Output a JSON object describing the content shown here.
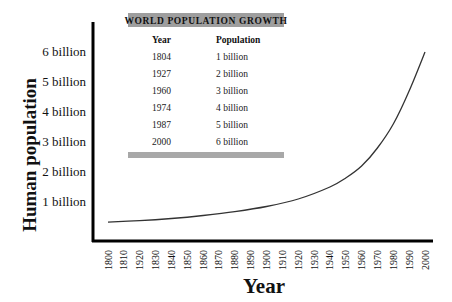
{
  "chart_data": {
    "type": "line",
    "title": "",
    "xlabel": "Year",
    "ylabel": "Human population",
    "x_ticks": [
      "1800",
      "1810",
      "1920",
      "1830",
      "1840",
      "1850",
      "1860",
      "1870",
      "1880",
      "1890",
      "1900",
      "1910",
      "1920",
      "1930",
      "1940",
      "1950",
      "1960",
      "1970",
      "1980",
      "1990",
      "2000"
    ],
    "y_ticks": [
      "1 billion",
      "2 billion",
      "3 billion",
      "4 billion",
      "5 billion",
      "6 billion"
    ],
    "xlim": [
      1800,
      2000
    ],
    "ylim": [
      0,
      6
    ],
    "grid": false,
    "series": [
      {
        "name": "Human population (billions)",
        "x": [
          1800,
          1820,
          1840,
          1860,
          1880,
          1900,
          1920,
          1940,
          1950,
          1960,
          1970,
          1980,
          1990,
          2000
        ],
        "values": [
          0.33,
          0.38,
          0.45,
          0.55,
          0.68,
          0.85,
          1.1,
          1.5,
          1.8,
          2.2,
          2.8,
          3.6,
          4.7,
          6.0
        ]
      }
    ],
    "inset_table": {
      "title": "WORLD POPULATION GROWTH",
      "columns": [
        "Year",
        "Population"
      ],
      "rows": [
        [
          "1804",
          "1 billion"
        ],
        [
          "1927",
          "2 billion"
        ],
        [
          "1960",
          "3 billion"
        ],
        [
          "1974",
          "4 billion"
        ],
        [
          "1987",
          "5 billion"
        ],
        [
          "2000",
          "6 billion"
        ]
      ]
    },
    "colors": {
      "line": "#333333",
      "axis": "#000000",
      "table_banner": "#9e9e9e"
    }
  }
}
